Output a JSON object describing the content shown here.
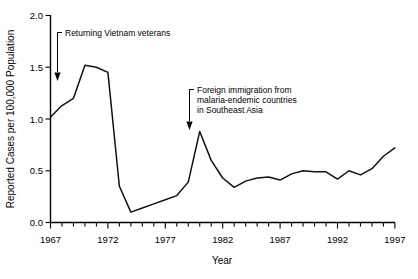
{
  "chart_data": {
    "type": "line",
    "title": "",
    "xlabel": "Year",
    "ylabel": "Reported Cases per 100,000 Population",
    "xlim": [
      1967,
      1997
    ],
    "ylim": [
      0.0,
      2.0
    ],
    "grid": false,
    "legend": null,
    "y_ticks": [
      "0.0",
      "0.5",
      "1.0",
      "1.5",
      "2.0"
    ],
    "y_tick_values": [
      0.0,
      0.5,
      1.0,
      1.5,
      2.0
    ],
    "x_ticks": [
      "1967",
      "1972",
      "1977",
      "1982",
      "1987",
      "1992",
      "1997"
    ],
    "x_tick_values": [
      1967,
      1972,
      1977,
      1982,
      1987,
      1992,
      1997
    ],
    "x_minor_tick_interval": 1,
    "series": [
      {
        "name": "Reported malaria cases",
        "x": [
          1967,
          1968,
          1969,
          1970,
          1971,
          1972,
          1973,
          1974,
          1975,
          1976,
          1977,
          1978,
          1979,
          1980,
          1981,
          1982,
          1983,
          1984,
          1985,
          1986,
          1987,
          1988,
          1989,
          1990,
          1991,
          1992,
          1993,
          1994,
          1995,
          1996,
          1997
        ],
        "values": [
          1.02,
          1.13,
          1.2,
          1.52,
          1.5,
          1.45,
          0.35,
          0.1,
          0.14,
          0.18,
          0.22,
          0.26,
          0.39,
          0.88,
          0.6,
          0.43,
          0.34,
          0.4,
          0.43,
          0.44,
          0.41,
          0.47,
          0.5,
          0.49,
          0.49,
          0.42,
          0.5,
          0.46,
          0.52,
          0.64,
          0.72
        ]
      }
    ],
    "annotations": [
      {
        "id": "annot-vietnam",
        "text": "Returning Vietnam veterans",
        "text_lines": [
          "Returning Vietnam veterans"
        ],
        "arrow_points_to_year": 1967.4,
        "arrow_points_to_value": 1.28
      },
      {
        "id": "annot-immigration",
        "text": "Foreign immigration from malaria-endemic countries in Southeast Asia",
        "text_lines": [
          "Foreign immigration from",
          "malaria-endemic countries",
          "in Southeast Asia"
        ],
        "arrow_points_to_year": 1980.0,
        "arrow_points_to_value": 1.0
      }
    ],
    "colors": {
      "line": "#111111",
      "axis": "#000000",
      "background": "#ffffff",
      "text": "#000000"
    }
  }
}
